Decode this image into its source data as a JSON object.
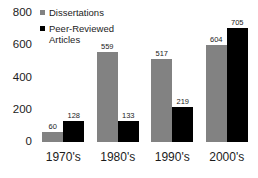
{
  "chart_data": {
    "type": "bar",
    "title": "",
    "xlabel": "",
    "ylabel": "",
    "ylim": [
      0,
      800
    ],
    "yticks": [
      "0",
      "200",
      "400",
      "600",
      "800"
    ],
    "grid": false,
    "legend_position": "top-left",
    "categories": [
      "1970's",
      "1980's",
      "1990's",
      "2000's"
    ],
    "series": [
      {
        "name": "Dissertations",
        "color": "#828282",
        "values": [
          60,
          559,
          517,
          604
        ],
        "labels": [
          "60",
          "559",
          "517",
          "604"
        ]
      },
      {
        "name": "Peer-Reviewed Articles",
        "color": "#000000",
        "values": [
          128,
          133,
          219,
          705
        ],
        "labels": [
          "128",
          "133",
          "219",
          "705"
        ]
      }
    ]
  },
  "legend": {
    "items": [
      {
        "label": "Dissertations",
        "swatch": "legend-swatch-dissertations"
      },
      {
        "label": "Peer-Reviewed Articles",
        "swatch": "legend-swatch-articles"
      }
    ]
  }
}
